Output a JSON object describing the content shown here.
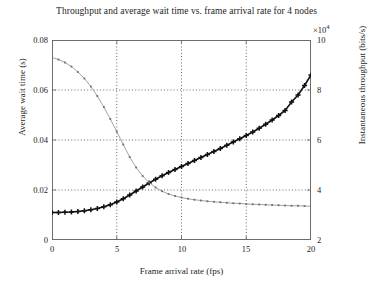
{
  "chart_data": {
    "type": "line",
    "title": "Throughput and average wait time vs. frame arrival rate for 4 nodes",
    "xlabel": "Frame arrival rate (fps)",
    "ylabel": "Average wait time (s)",
    "y2label": "Instantaneous throughput (bits/s)",
    "y2_exponent_prefix": "×10",
    "y2_exponent_power": "4",
    "xlim": [
      0,
      20
    ],
    "ylim": [
      0,
      0.08
    ],
    "y2lim": [
      2,
      10
    ],
    "xticks": [
      0,
      5,
      10,
      15,
      20
    ],
    "xtick_labels": [
      "0",
      "5",
      "10",
      "15",
      "20"
    ],
    "yticks": [
      0,
      0.02,
      0.04,
      0.06,
      0.08
    ],
    "ytick_labels": [
      "0",
      "0.02",
      "0.04",
      "0.06",
      "0.08"
    ],
    "y2ticks": [
      2,
      4,
      6,
      8,
      10
    ],
    "y2tick_labels": [
      "2",
      "4",
      "6",
      "8",
      "10"
    ],
    "grid": true,
    "grid_style": "dotted",
    "legend": "none",
    "series": [
      {
        "name": "Average wait time",
        "axis": "left",
        "marker": "plus",
        "marker_color": "#111111",
        "line_color": "#111111",
        "line_width": 1.6,
        "x": [
          0,
          0.5,
          1,
          1.5,
          2,
          2.5,
          3,
          3.5,
          4,
          4.5,
          5,
          5.5,
          6,
          6.5,
          7,
          7.5,
          8,
          8.5,
          9,
          9.5,
          10,
          10.5,
          11,
          11.5,
          12,
          12.5,
          13,
          13.5,
          14,
          14.5,
          15,
          15.5,
          16,
          16.5,
          17,
          17.5,
          18,
          18.5,
          19,
          19.5,
          20
        ],
        "y": [
          0.011,
          0.011,
          0.0111,
          0.0112,
          0.0114,
          0.0117,
          0.0121,
          0.0126,
          0.0133,
          0.0141,
          0.0152,
          0.0165,
          0.018,
          0.0196,
          0.0212,
          0.0228,
          0.0243,
          0.0257,
          0.027,
          0.0282,
          0.0294,
          0.0306,
          0.0318,
          0.033,
          0.0342,
          0.0354,
          0.0366,
          0.0379,
          0.0392,
          0.0405,
          0.0418,
          0.0432,
          0.0447,
          0.0463,
          0.048,
          0.0498,
          0.0518,
          0.0552,
          0.058,
          0.0618,
          0.066
        ]
      },
      {
        "name": "Instantaneous throughput",
        "axis": "right",
        "marker": "dot",
        "marker_color": "#6b6b6b",
        "line_color": "#8a8a8a",
        "line_width": 0.8,
        "x": [
          0,
          0.5,
          1,
          1.5,
          2,
          2.5,
          3,
          3.5,
          4,
          4.5,
          5,
          5.5,
          6,
          6.5,
          7,
          7.5,
          8,
          8.5,
          9,
          9.5,
          10,
          10.5,
          11,
          11.5,
          12,
          12.5,
          13,
          13.5,
          14,
          14.5,
          15,
          15.5,
          16,
          16.5,
          17,
          17.5,
          18,
          18.5,
          19,
          19.5,
          20
        ],
        "y_right": [
          9.3,
          9.22,
          9.1,
          8.94,
          8.72,
          8.46,
          8.14,
          7.76,
          7.32,
          6.84,
          6.34,
          5.82,
          5.32,
          4.9,
          4.56,
          4.3,
          4.1,
          3.95,
          3.84,
          3.76,
          3.7,
          3.65,
          3.61,
          3.58,
          3.55,
          3.53,
          3.51,
          3.49,
          3.47,
          3.46,
          3.44,
          3.43,
          3.42,
          3.41,
          3.4,
          3.39,
          3.38,
          3.37,
          3.37,
          3.36,
          3.35
        ]
      }
    ],
    "crossover": {
      "x": 8.7,
      "y_left": 0.0248,
      "y_right": 5.1
    }
  },
  "colors": {
    "frame": "#6d6d6d",
    "grid": "#2b2b2b",
    "wait_series": "#111111",
    "throughput_series": "#8a8a8a",
    "background": "#ffffff"
  }
}
